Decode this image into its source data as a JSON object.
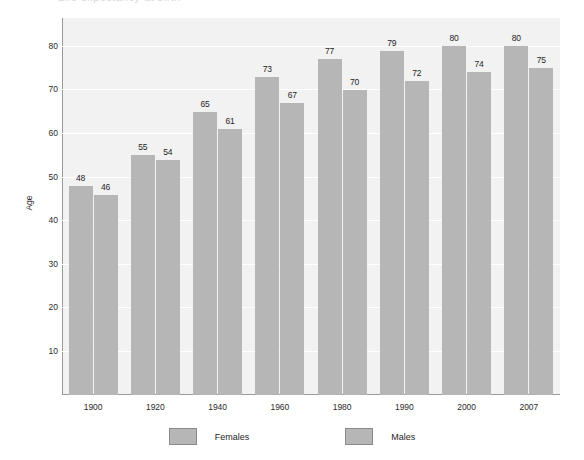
{
  "title_sliver": "Life expectancy at birth",
  "chart_data": {
    "type": "bar",
    "title": "",
    "xlabel": "",
    "ylabel": "Age",
    "ylim": [
      0,
      86.5
    ],
    "yticks": [
      10,
      20,
      30,
      40,
      50,
      60,
      70,
      80
    ],
    "grid": true,
    "legend_position": "bottom",
    "categories": [
      "1900",
      "1920",
      "1940",
      "1960",
      "1980",
      "1990",
      "2000",
      "2007"
    ],
    "series": [
      {
        "name": "Females",
        "values": [
          48,
          55,
          65,
          73,
          77,
          79,
          80,
          80
        ],
        "color": "#b6b6b6"
      },
      {
        "name": "Males",
        "values": [
          46,
          54,
          61,
          67,
          70,
          72,
          74,
          75
        ],
        "color": "#b6b6b6"
      }
    ]
  },
  "colors": {
    "bar": "#b6b6b6",
    "plot_background": "#f2f2f2",
    "gridline": "#ffffff",
    "axis": "#9a9a9a",
    "text": "#1e1e1e"
  }
}
